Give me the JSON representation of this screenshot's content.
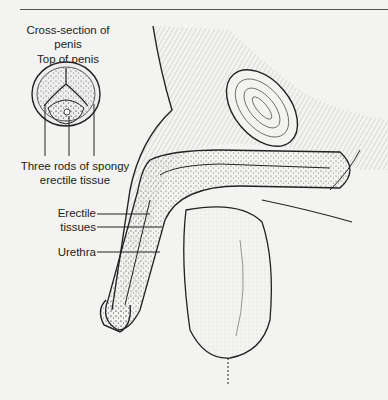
{
  "diagram": {
    "type": "anatomical illustration",
    "labels": {
      "cross_section_title_line1": "Cross-section of",
      "cross_section_title_line2": "penis",
      "top_label": "Top of penis",
      "rods_line1": "Three rods of spongy",
      "rods_line2": "erectile tissue",
      "erectile_line1": "Erectile",
      "erectile_line2": "tissues",
      "urethra": "Urethra"
    },
    "colors": {
      "background": "#f3f3f1",
      "ink": "#222222",
      "stipple": "#6a6a6a"
    }
  }
}
